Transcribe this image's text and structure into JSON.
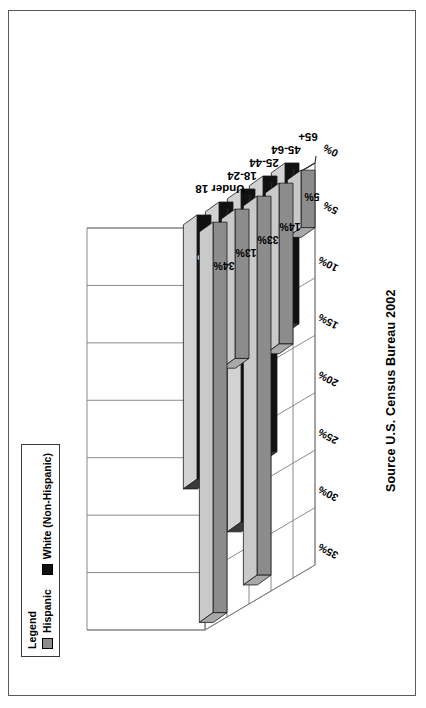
{
  "legend": {
    "title": "Legend",
    "items": [
      {
        "label": "Hispanic",
        "color": "#8c8c8c"
      },
      {
        "label": "White (Non-Hispanic)",
        "color": "#101010"
      }
    ]
  },
  "source_note": "Source U.S. Census Bureau 2002",
  "colors": {
    "hispanic_top": "#c9c9c9",
    "hispanic_front": "#8c8c8c",
    "hispanic_side": "#a8a8a8",
    "white_top": "#d2d2d2",
    "white_front": "#111111",
    "white_side": "#3a3a3a",
    "floor": "#ffffff",
    "gridline": "#7d7d7d",
    "outline": "#1a1a1a",
    "page_border": "#5a5a5a"
  },
  "chart_data": {
    "type": "bar",
    "title": "",
    "subtitle": "",
    "xlabel": "",
    "ylabel": "",
    "categories": [
      "Under 18",
      "18-24",
      "25-44",
      "45-64",
      "65+"
    ],
    "series": [
      {
        "name": "Hispanic",
        "values": [
          34,
          13,
          33,
          14,
          5
        ],
        "color": "#8c8c8c"
      },
      {
        "name": "White (Non-Hispanic)",
        "values": [
          23,
          9,
          29,
          24,
          14
        ],
        "color": "#111111"
      }
    ],
    "value_labels": [
      [
        "34%",
        "13%",
        "33%",
        "14%",
        "5%"
      ],
      [
        "23%",
        "9%",
        "29%",
        "24%",
        "14%"
      ]
    ],
    "tick_labels": [
      "0%",
      "5%",
      "10%",
      "15%",
      "20%",
      "25%",
      "30%",
      "35%"
    ],
    "tick_values": [
      0,
      5,
      10,
      15,
      20,
      25,
      30,
      35
    ],
    "ylim": [
      0,
      35
    ],
    "grid": true,
    "legend_position": "top-left",
    "projection": "3d",
    "orientation": "horizontal-bars-rotated-page"
  }
}
